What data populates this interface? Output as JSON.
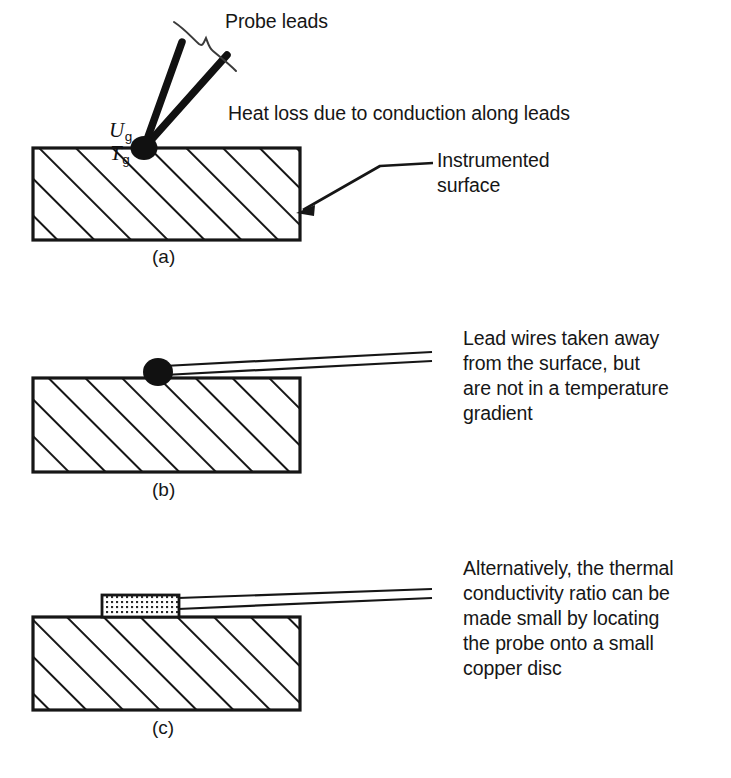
{
  "figure": {
    "background_color": "#ffffff",
    "ink_color": "#161616"
  },
  "panels": [
    {
      "id": "a",
      "caption": "(a)",
      "symbols": [
        {
          "base": "U",
          "subscript": "g"
        },
        {
          "base": "T",
          "subscript": "g"
        }
      ],
      "annotations": [
        {
          "name": "probe-leads-label",
          "text": "Probe leads"
        },
        {
          "name": "heat-loss-label",
          "text": "Heat loss due to conduction along leads"
        },
        {
          "name": "instrumented-surface-label",
          "lines": [
            "Instrumented",
            "surface"
          ]
        }
      ]
    },
    {
      "id": "b",
      "caption": "(b)",
      "annotations": [
        {
          "name": "lead-wires-note",
          "lines": [
            "Lead wires taken away",
            "from the surface, but",
            "are not in a temperature",
            "gradient"
          ]
        }
      ]
    },
    {
      "id": "c",
      "caption": "(c)",
      "annotations": [
        {
          "name": "copper-disc-note",
          "lines": [
            "Alternatively, the thermal",
            "conductivity ratio can be",
            "made small by locating",
            "the probe onto a small",
            "copper disc"
          ]
        }
      ]
    }
  ],
  "labels": {
    "probe_leads": "Probe leads",
    "heat_loss": "Heat loss due to conduction along leads",
    "instrumented_surface_l1": "Instrumented",
    "instrumented_surface_l2": "surface",
    "lead_wires_l1": "Lead wires taken away",
    "lead_wires_l2": "from the surface, but",
    "lead_wires_l3": "are not in a temperature",
    "lead_wires_l4": "gradient",
    "copper_l1": "Alternatively, the thermal",
    "copper_l2": "conductivity ratio can be",
    "copper_l3": "made small by locating",
    "copper_l4": "the probe onto a small",
    "copper_l5": "copper disc",
    "caption_a": "(a)",
    "caption_b": "(b)",
    "caption_c": "(c)",
    "sym_u_base": "U",
    "sym_u_sub": "g",
    "sym_t_base": "T",
    "sym_t_sub": "g"
  }
}
